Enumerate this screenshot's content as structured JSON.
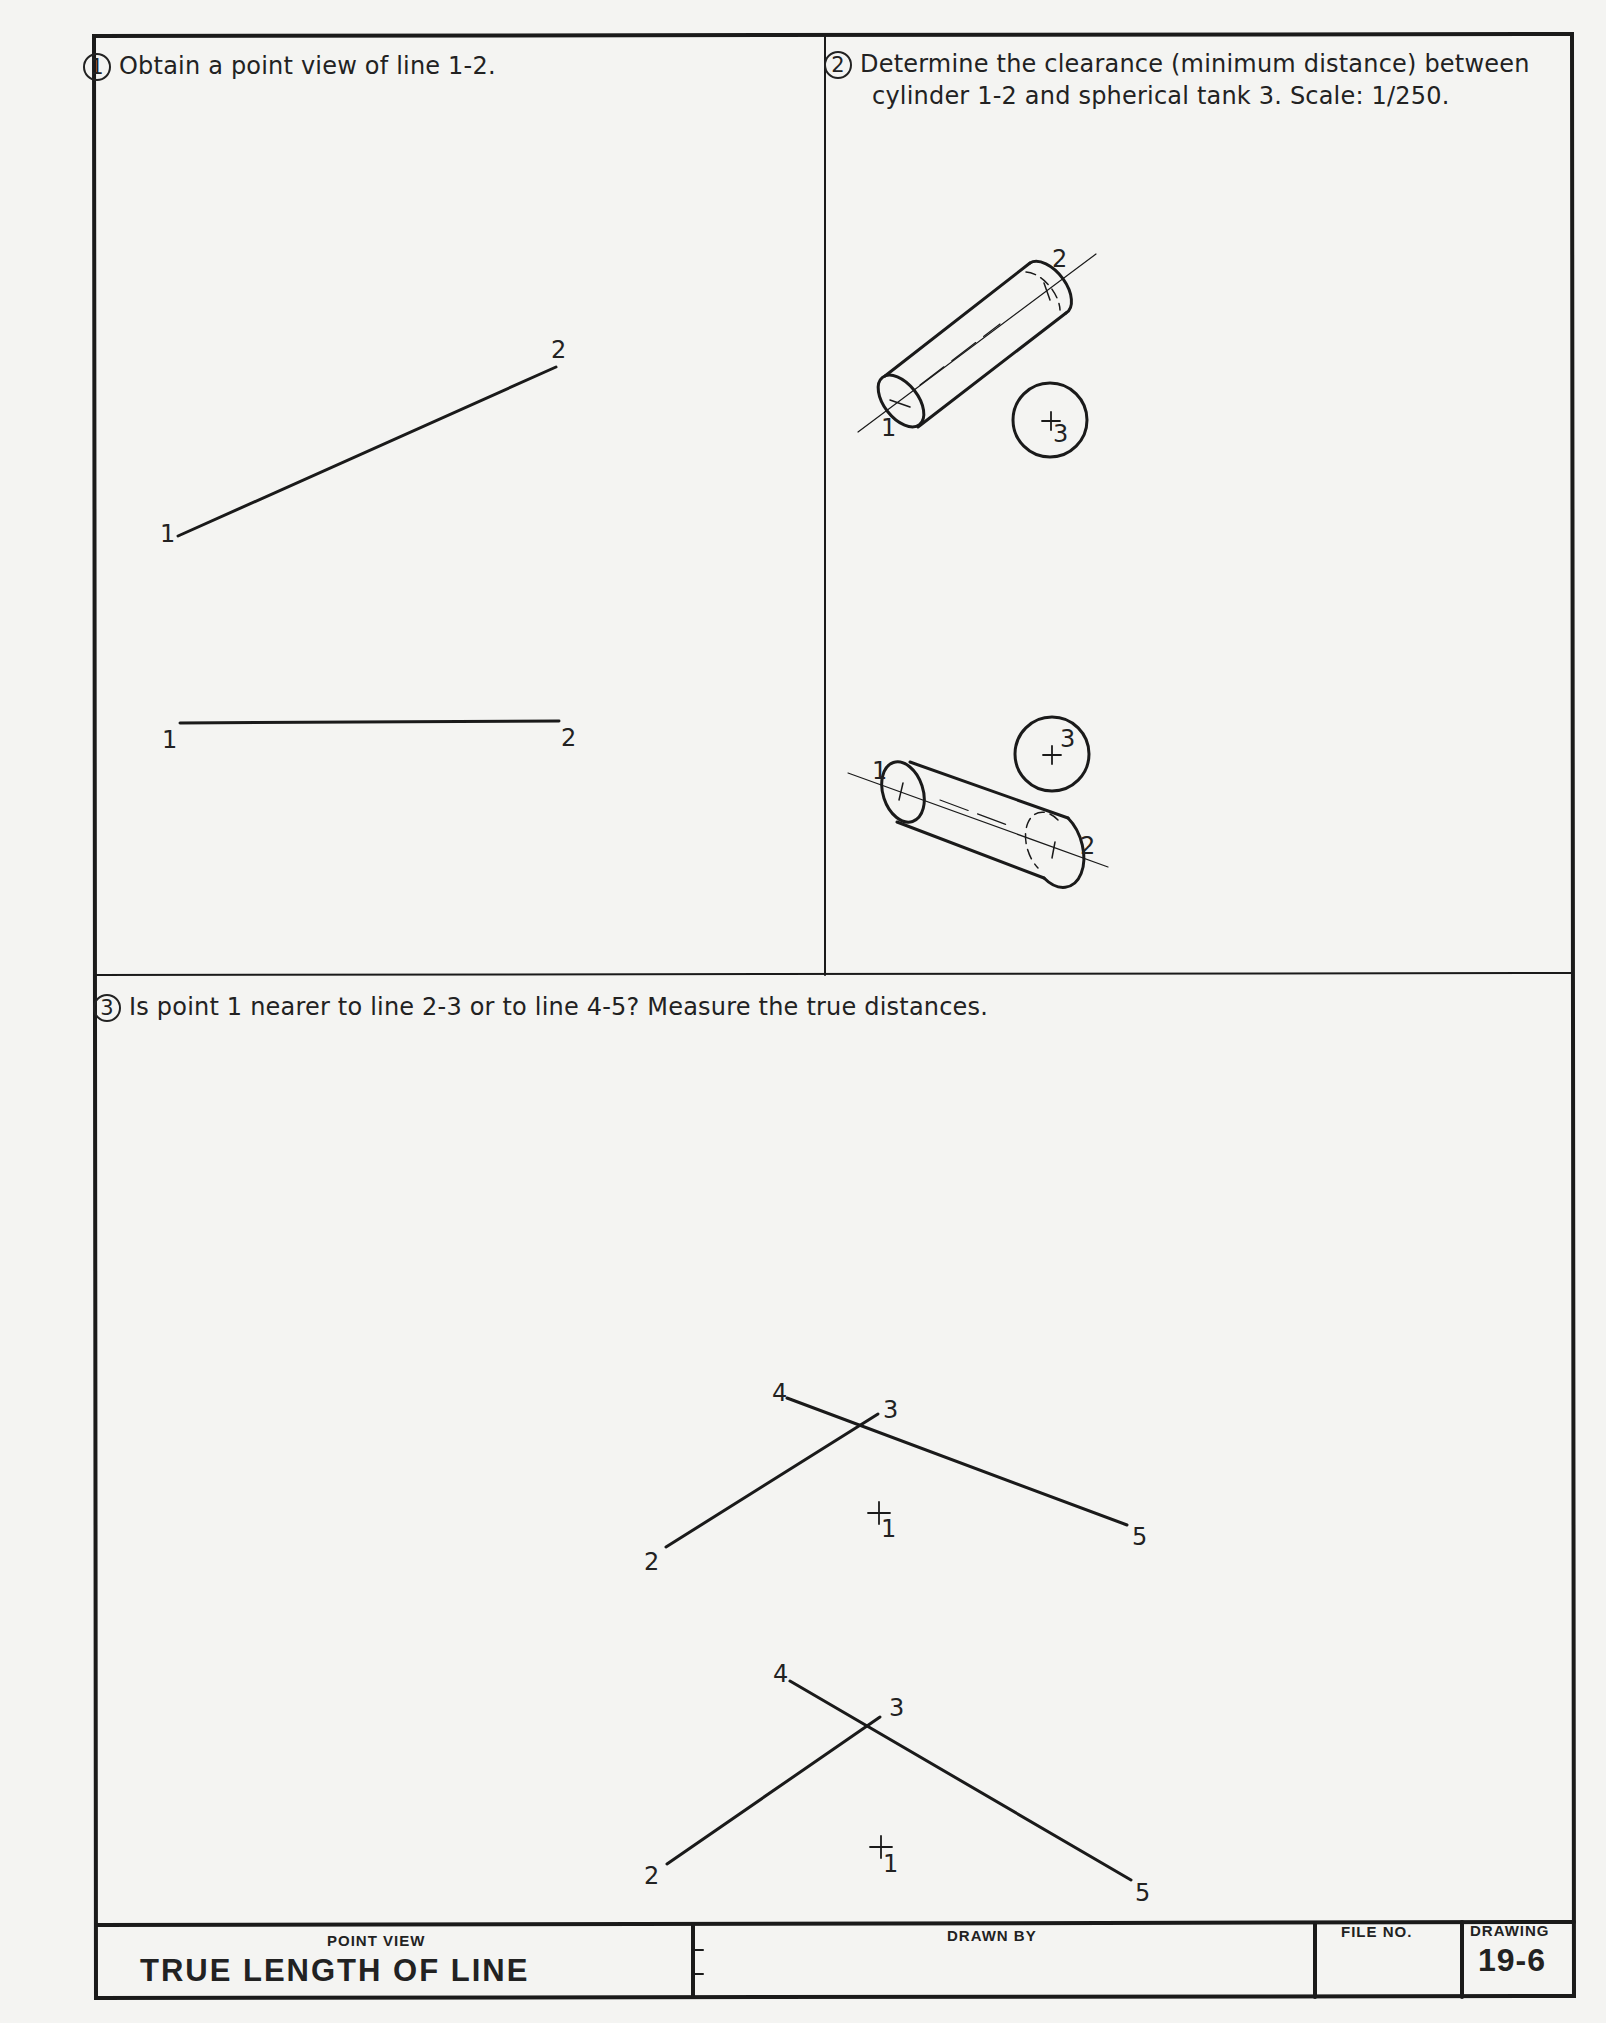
{
  "sheet": {
    "border_color": "#1a1a1a",
    "background": "#f4f4f2"
  },
  "problems": [
    {
      "number": "1",
      "text": "Obtain a point view of line 1-2.",
      "labels": {
        "top_1": "1",
        "top_2": "2",
        "front_1": "1",
        "front_2": "2"
      }
    },
    {
      "number": "2",
      "text_line1": "Determine the clearance (minimum distance) between",
      "text_line2": "cylinder 1-2 and spherical tank 3. Scale: 1/250.",
      "labels": {
        "top_1": "1",
        "top_2": "2",
        "top_3": "3",
        "front_1": "1",
        "front_2": "2",
        "front_3": "3"
      }
    },
    {
      "number": "3",
      "text": "Is point 1 nearer to line 2-3 or to line 4-5? Measure the true distances.",
      "labels": {
        "top_4": "4",
        "top_3": "3",
        "top_2": "2",
        "top_5": "5",
        "top_1": "1",
        "front_4": "4",
        "front_3": "3",
        "front_2": "2",
        "front_5": "5",
        "front_1": "1"
      }
    }
  ],
  "title_block": {
    "subtitle": "POINT VIEW",
    "title": "TRUE LENGTH OF LINE",
    "drawn_by_label": "DRAWN BY",
    "file_no_label": "FILE NO.",
    "drawing_label": "DRAWING",
    "drawing_number": "19-6"
  }
}
